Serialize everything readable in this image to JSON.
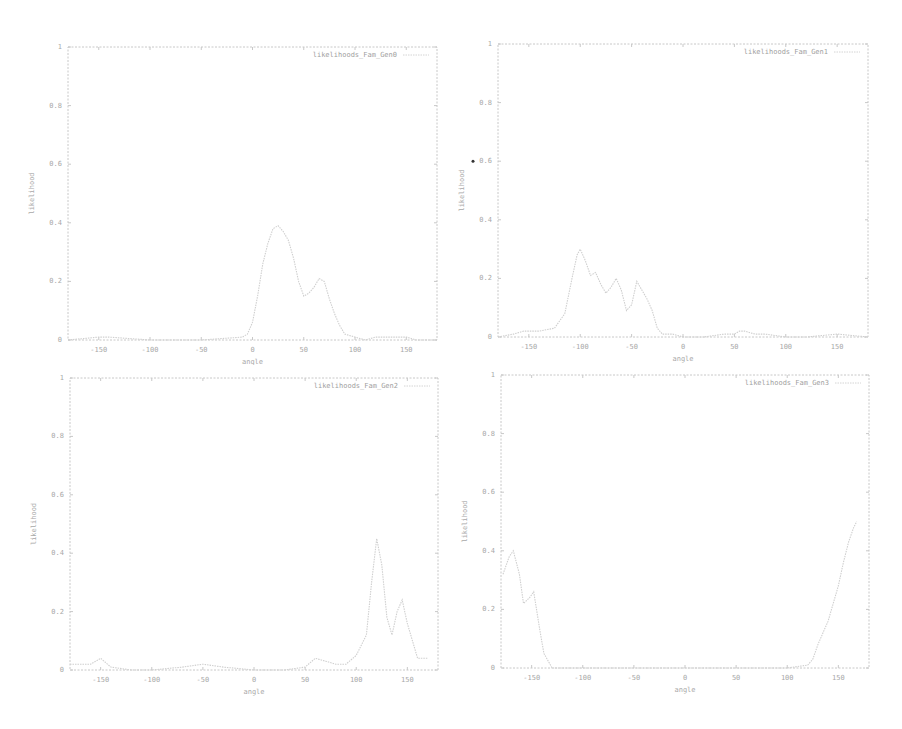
{
  "colors": {
    "frame": "#c8c8c8",
    "curve": "#cfcfcf",
    "text": "#a8a8a8",
    "background": "#ffffff"
  },
  "chart_data": [
    {
      "type": "line",
      "title": "",
      "xlabel": "angle",
      "ylabel": "likelihood",
      "xlim": [
        -180,
        180
      ],
      "ylim": [
        0,
        1
      ],
      "xticks": [
        "-150",
        "-100",
        "-50",
        "0",
        "50",
        "100",
        "150"
      ],
      "yticks": [
        "0",
        "0.2",
        "0.4",
        "0.6",
        "0.8",
        "1"
      ],
      "legend": {
        "position": "top-right",
        "entries": [
          "likelihoods_Fam_Gen0"
        ]
      },
      "grid": false,
      "series": [
        {
          "name": "likelihoods_Fam_Gen0",
          "x": [
            -180,
            -150,
            -140,
            -100,
            -50,
            -10,
            -5,
            0,
            5,
            10,
            15,
            20,
            25,
            30,
            35,
            40,
            45,
            50,
            55,
            60,
            65,
            70,
            75,
            80,
            85,
            90,
            100,
            110,
            120,
            130,
            140,
            150,
            160,
            170,
            180
          ],
          "values": [
            0,
            0.01,
            0.01,
            0,
            0,
            0.01,
            0.02,
            0.06,
            0.15,
            0.26,
            0.33,
            0.38,
            0.39,
            0.37,
            0.34,
            0.28,
            0.2,
            0.15,
            0.16,
            0.18,
            0.21,
            0.2,
            0.14,
            0.09,
            0.05,
            0.02,
            0.01,
            0,
            0.01,
            0.01,
            0.01,
            0.01,
            0,
            0,
            0
          ]
        }
      ]
    },
    {
      "type": "line",
      "title": "",
      "xlabel": "angle",
      "ylabel": "likelihood",
      "xlim": [
        -180,
        180
      ],
      "ylim": [
        0,
        1
      ],
      "xticks": [
        "-150",
        "-100",
        "-50",
        "0",
        "50",
        "100",
        "150"
      ],
      "yticks": [
        "0",
        "0.2",
        "0.4",
        "0.6",
        "0.8",
        "1"
      ],
      "legend": {
        "position": "top-right",
        "entries": [
          "likelihoods_Fam_Gen1"
        ]
      },
      "grid": false,
      "series": [
        {
          "name": "likelihoods_Fam_Gen1",
          "x": [
            -180,
            -165,
            -155,
            -140,
            -125,
            -115,
            -108,
            -103,
            -100,
            -95,
            -90,
            -85,
            -80,
            -75,
            -70,
            -65,
            -60,
            -55,
            -50,
            -45,
            -40,
            -35,
            -30,
            -25,
            -20,
            -10,
            0,
            20,
            40,
            50,
            55,
            60,
            70,
            80,
            100,
            120,
            150,
            180
          ],
          "values": [
            0,
            0.01,
            0.02,
            0.02,
            0.03,
            0.08,
            0.2,
            0.28,
            0.3,
            0.26,
            0.21,
            0.22,
            0.18,
            0.15,
            0.17,
            0.2,
            0.16,
            0.09,
            0.11,
            0.19,
            0.16,
            0.13,
            0.09,
            0.03,
            0.01,
            0.01,
            0,
            0,
            0.01,
            0.01,
            0.02,
            0.02,
            0.01,
            0.01,
            0,
            0,
            0.01,
            0
          ]
        }
      ]
    },
    {
      "type": "line",
      "title": "",
      "xlabel": "angle",
      "ylabel": "likelihood",
      "xlim": [
        -180,
        180
      ],
      "ylim": [
        0,
        1
      ],
      "xticks": [
        "-150",
        "-100",
        "-50",
        "0",
        "50",
        "100",
        "150"
      ],
      "yticks": [
        "0",
        "0.2",
        "0.4",
        "0.6",
        "0.8",
        "1"
      ],
      "legend": {
        "position": "top-right",
        "entries": [
          "likelihoods_Fam_Gen2"
        ]
      },
      "grid": false,
      "series": [
        {
          "name": "likelihoods_Fam_Gen2",
          "x": [
            -180,
            -160,
            -150,
            -140,
            -120,
            -100,
            -70,
            -50,
            -30,
            0,
            30,
            50,
            60,
            70,
            80,
            90,
            100,
            110,
            115,
            120,
            125,
            130,
            135,
            140,
            145,
            150,
            160,
            170
          ],
          "values": [
            0.02,
            0.02,
            0.04,
            0.01,
            0,
            0,
            0.01,
            0.02,
            0.01,
            0,
            0,
            0.01,
            0.04,
            0.03,
            0.02,
            0.02,
            0.05,
            0.12,
            0.3,
            0.45,
            0.36,
            0.18,
            0.12,
            0.2,
            0.24,
            0.16,
            0.04,
            0.04
          ]
        }
      ]
    },
    {
      "type": "line",
      "title": "",
      "xlabel": "angle",
      "ylabel": "likelihood",
      "xlim": [
        -180,
        180
      ],
      "ylim": [
        0,
        1
      ],
      "xticks": [
        "-150",
        "-100",
        "-50",
        "0",
        "50",
        "100",
        "150"
      ],
      "yticks": [
        "0",
        "0.2",
        "0.4",
        "0.6",
        "0.8",
        "1"
      ],
      "legend": {
        "position": "top-right",
        "entries": [
          "likelihoods_Fam_Gen3"
        ]
      },
      "grid": false,
      "series": [
        {
          "name": "likelihoods_Fam_Gen3",
          "x": [
            -178,
            -172,
            -168,
            -162,
            -158,
            -152,
            -148,
            -142,
            -138,
            -130,
            -100,
            -50,
            0,
            50,
            100,
            120,
            125,
            130,
            135,
            140,
            145,
            150,
            155,
            160,
            165,
            168
          ],
          "values": [
            0.32,
            0.38,
            0.4,
            0.32,
            0.22,
            0.24,
            0.26,
            0.13,
            0.05,
            0,
            0,
            0,
            0,
            0,
            0,
            0.01,
            0.03,
            0.08,
            0.12,
            0.16,
            0.22,
            0.28,
            0.36,
            0.43,
            0.48,
            0.5
          ]
        }
      ]
    }
  ]
}
